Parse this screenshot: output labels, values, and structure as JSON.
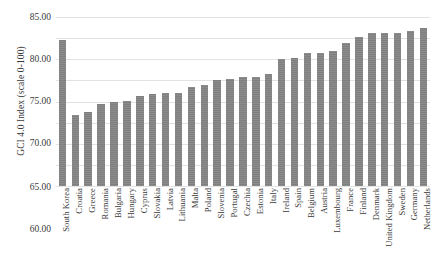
{
  "chart_data": {
    "type": "bar",
    "title": "",
    "xlabel": "",
    "ylabel": "GCI 4.0 Index (scale 0-100)",
    "ylim": [
      45.0,
      85.0
    ],
    "ytick_labels": [
      "85.00",
      "80.00",
      "75.00",
      "70.00",
      "65.00",
      "60.00",
      "55.00",
      "50.00",
      "45.00"
    ],
    "ytick_values": [
      85.0,
      80.0,
      75.0,
      70.0,
      65.0,
      60.0,
      55.0,
      50.0,
      45.0
    ],
    "grid": true,
    "legend": "none",
    "bar_color": "#7f7f7f",
    "categories": [
      "South Korea",
      "Croatia",
      "Greece",
      "Romania",
      "Bulgaria",
      "Hungary",
      "Cyprus",
      "Slovakia",
      "Latvia",
      "Lithuania",
      "Malta",
      "Poland",
      "Slovenia",
      "Portugal",
      "Czechia",
      "Estonia",
      "Italy",
      "Ireland",
      "Spain",
      "Belgium",
      "Austria",
      "Luxembourg",
      "France",
      "Finland",
      "Denmark",
      "United Kingdom",
      "Sweden",
      "Germany",
      "Netherlands"
    ],
    "values": [
      79.6,
      61.9,
      62.6,
      64.4,
      64.9,
      65.1,
      66.4,
      66.8,
      66.9,
      67.0,
      68.5,
      68.9,
      70.2,
      70.4,
      70.9,
      70.9,
      71.5,
      75.1,
      75.3,
      76.4,
      76.6,
      77.0,
      78.8,
      80.2,
      81.2,
      81.2,
      81.2,
      81.8,
      82.4
    ]
  }
}
